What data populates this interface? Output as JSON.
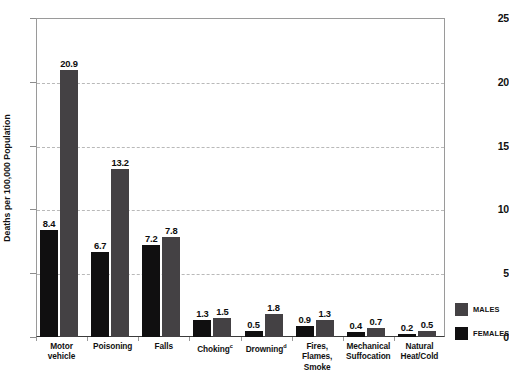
{
  "chart_data": {
    "type": "bar",
    "title": "",
    "xlabel": "",
    "ylabel": "Deaths per 100,000 Population",
    "ylim": [
      0,
      25
    ],
    "yticks": [
      "0",
      "5",
      "10",
      "15",
      "20",
      "25"
    ],
    "ytick_values": [
      0,
      5,
      10,
      15,
      20,
      25
    ],
    "gridlines": [
      5,
      10,
      15,
      20
    ],
    "grid": true,
    "legend_position": "right",
    "categories": [
      "Motor vehicle",
      "Poisoning",
      "Falls",
      "Choking",
      "Drowning",
      "Fires, Flames, Smoke",
      "Mechanical Suffocation",
      "Natural Heat/Cold"
    ],
    "category_lines": [
      [
        "Motor",
        "vehicle"
      ],
      [
        "Poisoning"
      ],
      [
        "Falls"
      ],
      [
        "Choking"
      ],
      [
        "Drowning"
      ],
      [
        "Fires, Flames,",
        "Smoke"
      ],
      [
        "Mechanical",
        "Suffocation"
      ],
      [
        "Natural",
        "Heat/Cold"
      ]
    ],
    "category_footnotes": [
      "",
      "",
      "",
      "c",
      "d",
      "",
      "",
      ""
    ],
    "series": [
      {
        "name": "MALES",
        "color": "#100f10",
        "values": [
          8.4,
          6.7,
          7.2,
          1.3,
          0.5,
          0.9,
          0.4,
          0.2
        ],
        "labels": [
          "8.4",
          "6.7",
          "7.2",
          "1.3",
          "0.5",
          "0.9",
          "0.4",
          "0.2"
        ]
      },
      {
        "name": "FEMALES",
        "color": "#444144",
        "values": [
          20.9,
          13.2,
          7.8,
          1.5,
          1.8,
          1.3,
          0.7,
          0.5
        ],
        "labels": [
          "20.9",
          "13.2",
          "7.8",
          "1.5",
          "1.8",
          "1.3",
          "0.7",
          "0.5"
        ]
      }
    ]
  },
  "legend": {
    "items": [
      {
        "label": "MALES",
        "color": "#444144"
      },
      {
        "label": "FEMALES",
        "color": "#100f10"
      }
    ]
  }
}
